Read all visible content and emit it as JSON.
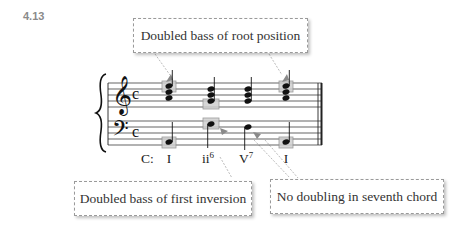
{
  "figure": {
    "number": "4.13"
  },
  "callouts": {
    "top": "Doubled bass of root position",
    "bottom_left": "Doubled bass of first inversion",
    "bottom_right": "No doubling in seventh chord"
  },
  "key": "C:",
  "chords": [
    {
      "numeral": "I",
      "figure": ""
    },
    {
      "numeral": "ii",
      "figure": "6"
    },
    {
      "numeral": "V",
      "figure": "7"
    },
    {
      "numeral": "I",
      "figure": ""
    }
  ],
  "staff": {
    "treble_clef": "𝄞",
    "bass_clef": "𝄢",
    "time_signature": "c"
  },
  "colors": {
    "highlight_fill": "#c8c8c8",
    "highlight_stroke": "#8c8c8c",
    "arrow": "#9a9a9a",
    "callout_border": "#9a9a9a"
  }
}
